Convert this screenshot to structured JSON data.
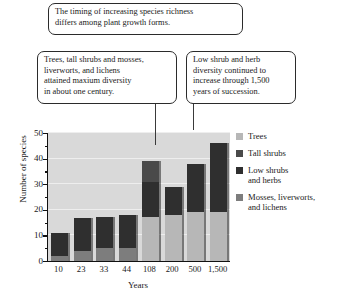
{
  "callouts": {
    "top": "The timing of increasing species richness\ndiffers among plant growth forms.",
    "left": "Trees, tall shrubs and mosses,\nliverworts, and lichens\nattained maxium diversity\nin about one century.",
    "right": "Low shrub and herb\ndiversity continued to\nincrease through 1,500\nyears of succession."
  },
  "chart_data": {
    "type": "bar",
    "subtype": "stacked",
    "title": "",
    "xlabel": "Years",
    "ylabel": "Number of species",
    "categories": [
      "10",
      "23",
      "33",
      "44",
      "108",
      "200",
      "500",
      "1,500"
    ],
    "ylim": [
      0,
      50
    ],
    "yticks": [
      0,
      10,
      20,
      30,
      40,
      50
    ],
    "ytick_labels": [
      "0",
      "10",
      "20",
      "30",
      "40",
      "50"
    ],
    "minor_tick_interval": 5,
    "grid": true,
    "grid_axis": "y",
    "legend_position": "right",
    "series": [
      {
        "name": "Mosses, liverworts, and lichens",
        "color": "#7d7d7d",
        "values": [
          2,
          4,
          5,
          5,
          0,
          0,
          0,
          0
        ]
      },
      {
        "name": "Trees",
        "color": "#b7b7b7",
        "values": [
          0,
          0,
          0,
          0,
          17,
          18,
          19,
          19
        ]
      },
      {
        "name": "Low shrubs and herbs",
        "color": "#2f2f2f",
        "values": [
          9,
          13,
          12,
          13,
          14,
          11,
          19,
          27
        ]
      },
      {
        "name": "Tall shrubs",
        "color": "#4a4a4a",
        "values": [
          0,
          0,
          0,
          0,
          8,
          0,
          0,
          0
        ]
      }
    ],
    "totals": [
      11,
      17,
      17,
      18,
      39,
      29,
      38,
      46
    ]
  },
  "legend": {
    "items": [
      {
        "label": "Trees",
        "color": "#b7b7b7"
      },
      {
        "label": "Tall shrubs",
        "color": "#4a4a4a"
      },
      {
        "label": "Low shrubs\nand herbs",
        "color": "#2f2f2f"
      },
      {
        "label": "Mosses, liverworts,\nand lichens",
        "color": "#7d7d7d"
      }
    ]
  }
}
